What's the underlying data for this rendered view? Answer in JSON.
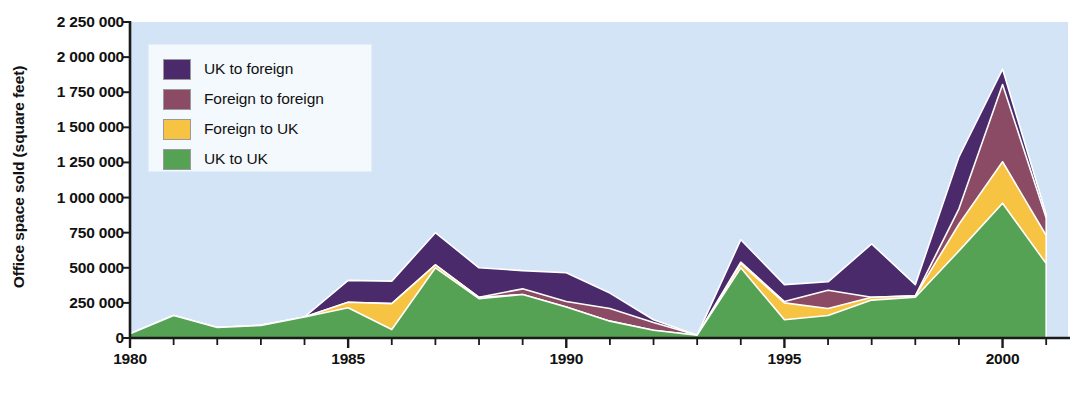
{
  "chart_data": {
    "type": "area",
    "stacked": true,
    "title": "",
    "xlabel": "",
    "ylabel": "Office space sold (square feet)",
    "x": [
      1980,
      1981,
      1982,
      1983,
      1984,
      1985,
      1986,
      1987,
      1988,
      1989,
      1990,
      1991,
      1992,
      1993,
      1994,
      1995,
      1996,
      1997,
      1998,
      1999,
      2000,
      2001
    ],
    "xlim": [
      1980,
      2001.5
    ],
    "ylim": [
      0,
      2250000
    ],
    "xtick_labels": [
      "1980",
      "1985",
      "1990",
      "1995",
      "2000"
    ],
    "xtick_values": [
      1980,
      1985,
      1990,
      1995,
      2000
    ],
    "ytick_labels": [
      "0",
      "250 000",
      "500 000",
      "750 000",
      "1 000 000",
      "1 250 000",
      "1 500 000",
      "1 750 000",
      "2 000 000",
      "2 250 000"
    ],
    "ytick_values": [
      0,
      250000,
      500000,
      750000,
      1000000,
      1250000,
      1500000,
      1750000,
      2000000,
      2250000
    ],
    "grid": false,
    "legend_position": "top-left",
    "plot_background": "#d2e4f5",
    "series": [
      {
        "name": "UK to UK",
        "color": "#56a255",
        "values": [
          30000,
          160000,
          75000,
          90000,
          150000,
          215000,
          60000,
          500000,
          280000,
          310000,
          220000,
          120000,
          55000,
          20000,
          500000,
          130000,
          160000,
          270000,
          290000,
          620000,
          960000,
          530000
        ]
      },
      {
        "name": "Foreign to UK",
        "color": "#f6c342",
        "values": [
          0,
          0,
          0,
          0,
          0,
          40000,
          185000,
          20000,
          10000,
          0,
          0,
          0,
          0,
          0,
          30000,
          120000,
          50000,
          20000,
          10000,
          190000,
          295000,
          200000
        ]
      },
      {
        "name": "Foreign to foreign",
        "color": "#8b4b64",
        "values": [
          0,
          0,
          0,
          0,
          0,
          0,
          0,
          0,
          0,
          40000,
          40000,
          90000,
          55000,
          0,
          10000,
          10000,
          130000,
          0,
          0,
          110000,
          550000,
          125000
        ]
      },
      {
        "name": "UK to foreign",
        "color": "#4a2a6b",
        "values": [
          0,
          0,
          0,
          0,
          0,
          155000,
          160000,
          230000,
          210000,
          130000,
          205000,
          110000,
          20000,
          0,
          160000,
          120000,
          60000,
          380000,
          80000,
          370000,
          110000,
          25000
        ]
      }
    ],
    "totals": [
      30000,
      160000,
      75000,
      90000,
      150000,
      410000,
      405000,
      750000,
      500000,
      480000,
      465000,
      320000,
      130000,
      20000,
      700000,
      380000,
      400000,
      670000,
      380000,
      1290000,
      1915000,
      880000
    ]
  },
  "legend": {
    "items": [
      {
        "label": "UK to foreign",
        "color": "#4a2a6b"
      },
      {
        "label": "Foreign to foreign",
        "color": "#8b4b64"
      },
      {
        "label": "Foreign to UK",
        "color": "#f6c342"
      },
      {
        "label": "UK to UK",
        "color": "#56a255"
      }
    ]
  },
  "axis": {
    "y_title": "Office space sold (square feet)"
  }
}
